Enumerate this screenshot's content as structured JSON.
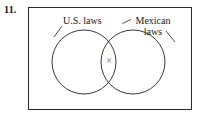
{
  "figure": {
    "item_number": "11.",
    "frame": {
      "stroke_color": "#2a2a2a"
    },
    "labels": {
      "left_set": "U.S. laws",
      "right_set_line1": "Mexican",
      "right_set_line2": "laws"
    },
    "marks": {
      "intersection_mark": "×",
      "intersection_mark_name": "x-mark",
      "intersection_mark_color": "#6b6b6b"
    },
    "diagram": {
      "type": "venn",
      "sets": 2,
      "set_names": [
        "U.S. laws",
        "Mexican laws"
      ],
      "left_circle": {
        "cx": 84,
        "cy": 62,
        "r": 32
      },
      "right_circle": {
        "cx": 133,
        "cy": 62,
        "r": 32
      },
      "circle_stroke": "#1f1f1f",
      "marked_region": "intersection",
      "leader_lines": [
        {
          "from_label": "U.S. laws",
          "x1": 62,
          "y1": 26,
          "x2": 54,
          "y2": 37
        },
        {
          "from_label": "Mexican laws",
          "x1": 131,
          "y1": 19,
          "x2": 122,
          "y2": 23
        },
        {
          "from_label": "Mexican laws",
          "x1": 166,
          "y1": 31,
          "x2": 175,
          "y2": 42
        }
      ]
    }
  }
}
